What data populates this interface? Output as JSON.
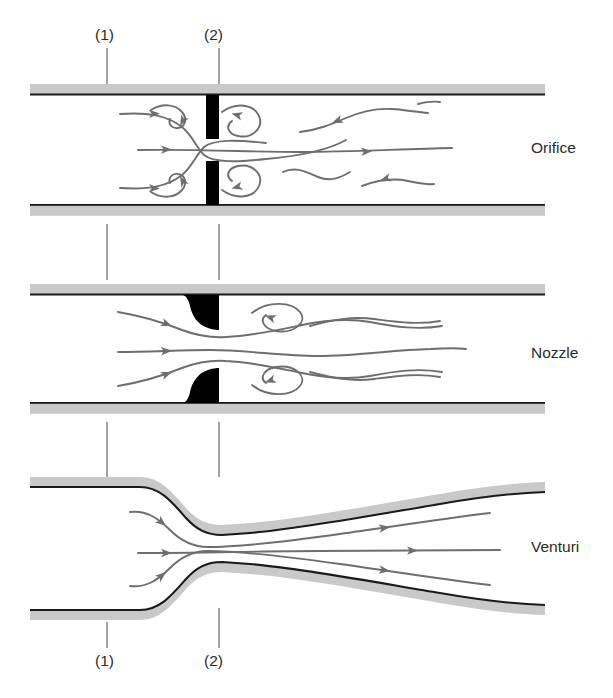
{
  "figure": {
    "background_color": "#ffffff",
    "wall_fill_color": "#c9c9c9",
    "wall_line_color": "#1a1a1a",
    "obstruction_color": "#000000",
    "streamline_color": "#6e6e6e",
    "leader_line_color": "#555555",
    "text_color": "#2b2b2b"
  },
  "station_labels": {
    "upstream": "(1)",
    "throat": "(2)"
  },
  "top_stations": [
    {
      "text": "(1)",
      "x": 95,
      "y": 27
    },
    {
      "text": "(2)",
      "x": 204,
      "y": 27
    }
  ],
  "bottom_stations": [
    {
      "text": "(1)",
      "x": 95,
      "y": 653
    },
    {
      "text": "(2)",
      "x": 204,
      "y": 653
    }
  ],
  "devices": [
    {
      "name": "orifice",
      "label": "Orifice",
      "label_x": 531,
      "label_y": 140,
      "pipe_top_y": 84,
      "pipe_bottom_y": 215,
      "description": "Flat orifice plate with separated recirculating wake"
    },
    {
      "name": "nozzle",
      "label": "Nozzle",
      "label_x": 531,
      "label_y": 345,
      "pipe_top_y": 284,
      "pipe_bottom_y": 413,
      "description": "Rounded flow nozzle with contoured inlet"
    },
    {
      "name": "venturi",
      "label": "Venturi",
      "label_x": 531,
      "label_y": 539,
      "pipe_top_y": 477,
      "pipe_bottom_y": 620,
      "description": "Venturi meter with gradual contraction and diffuser"
    }
  ]
}
